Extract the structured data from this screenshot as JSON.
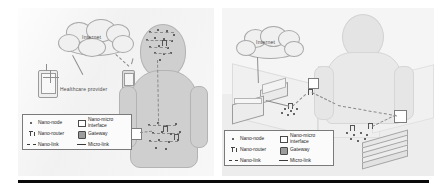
{
  "figure": {
    "background_color": "#f2f2f2",
    "rule_color": "#0a0a0a",
    "panels": [
      {
        "id": "left",
        "name": "body-area-nanonetwork-scenario",
        "cloud_label": "Internet",
        "annotations": [
          {
            "text": "Healthcare provider"
          }
        ]
      },
      {
        "id": "right",
        "name": "office-room-nanonetwork-scenario",
        "cloud_label": "Internet",
        "annotations": []
      }
    ]
  },
  "legend": {
    "entries": [
      {
        "symbol": "nano-node-symbol",
        "label": "Nano-node"
      },
      {
        "symbol": "nano-micro-interface-symbol",
        "label": "Nano-micro\ninterface"
      },
      {
        "symbol": "nano-router-symbol",
        "label": "Nano-router"
      },
      {
        "symbol": "gateway-symbol",
        "label": "Gateway"
      },
      {
        "symbol": "nano-link-symbol",
        "label": "Nano-link"
      },
      {
        "symbol": "micro-link-symbol",
        "label": "Micro-link"
      }
    ]
  },
  "colors": {
    "panel_bg": "#f2f2f2",
    "body_fill": "#cfcfcf",
    "stroke": "#8e8e8e",
    "text": "#262626",
    "rule": "#0a0a0a"
  }
}
